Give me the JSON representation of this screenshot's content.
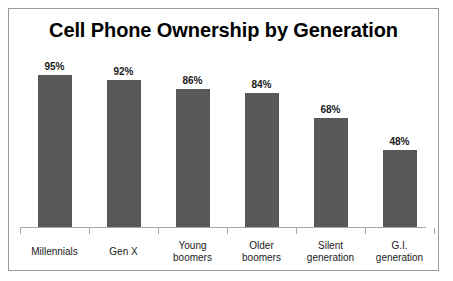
{
  "chart_data": {
    "type": "bar",
    "title": "Cell Phone Ownership by Generation",
    "xlabel": "",
    "ylabel": "",
    "ylim": [
      0,
      100
    ],
    "grid": false,
    "legend": "none",
    "value_suffix": "%",
    "categories": [
      "Millennials",
      "Young boomers",
      "Older boomers",
      "Silent generation",
      "G.I. generation",
      "Gen X"
    ],
    "bars": [
      {
        "category": "Millennials",
        "line1": "Millennials",
        "line2": "",
        "value": 95,
        "label": "95%"
      },
      {
        "category": "Gen X",
        "line1": "Gen X",
        "line2": "",
        "value": 92,
        "label": "92%"
      },
      {
        "category": "Young boomers",
        "line1": "Young",
        "line2": "boomers",
        "value": 86,
        "label": "86%"
      },
      {
        "category": "Older boomers",
        "line1": "Older",
        "line2": "boomers",
        "value": 84,
        "label": "84%"
      },
      {
        "category": "Silent generation",
        "line1": "Silent",
        "line2": "generation",
        "value": 68,
        "label": "68%"
      },
      {
        "category": "G.I. generation",
        "line1": "G.I.",
        "line2": "generation",
        "value": 48,
        "label": "48%"
      }
    ],
    "values": [
      95,
      92,
      86,
      84,
      68,
      48
    ],
    "colors": {
      "bar_fill": "#595959",
      "axis": "#a6a6a6",
      "border": "#9a9a9a",
      "background": "#ffffff",
      "text": "#1a1a1a",
      "title": "#000000"
    }
  }
}
